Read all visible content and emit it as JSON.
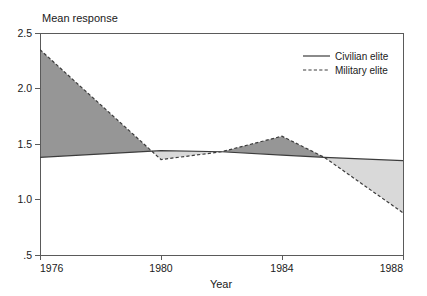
{
  "chart_data": {
    "type": "area",
    "title": "Mean response",
    "xlabel": "Year",
    "ylabel": "",
    "x": [
      1976,
      1980,
      1982,
      1984,
      1985.4,
      1988
    ],
    "xlim": [
      1976,
      1988
    ],
    "ylim": [
      0.5,
      2.5
    ],
    "grid": false,
    "legend_position": "top-right",
    "xticks": [
      "1976",
      "1980",
      "1984",
      "1988"
    ],
    "xtick_values": [
      1976,
      1980,
      1984,
      1988
    ],
    "yticks": [
      "2.5",
      "2.0",
      "1.5",
      "1.0",
      ".5"
    ],
    "ytick_values": [
      2.5,
      2.0,
      1.5,
      1.0,
      0.5
    ],
    "series": [
      {
        "name": "Civilian elite",
        "style": "solid",
        "values": [
          1.38,
          1.44,
          1.43,
          1.4,
          1.38,
          1.35
        ]
      },
      {
        "name": "Military elite",
        "style": "dashed",
        "values": [
          2.35,
          1.36,
          1.43,
          1.57,
          1.38,
          0.88
        ]
      }
    ],
    "fills": [
      {
        "name": "military-above-civilian",
        "color": "#969696",
        "label": "Military elite higher"
      },
      {
        "name": "civilian-above-military",
        "color": "#d9d9d9",
        "label": "Civilian elite higher"
      }
    ],
    "colors": {
      "line": "#3c3c3c",
      "frame": "#5a5a5a",
      "fill_dark": "#969696",
      "fill_light": "#d9d9d9",
      "background": "#ffffff"
    }
  },
  "legend": {
    "entries": [
      {
        "label": "Civilian elite",
        "style": "solid"
      },
      {
        "label": "Military elite",
        "style": "dashed"
      }
    ]
  }
}
